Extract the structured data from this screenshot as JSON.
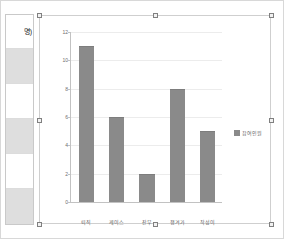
{
  "window": {
    "background": "#ffffff",
    "border_color": "#d8d8d8"
  },
  "spreadsheet_strip": {
    "name": "worksheet-column-strip",
    "visible_cell_text": "명)",
    "cells": [
      {
        "text": "명)",
        "shaded": false
      },
      {
        "text": "",
        "shaded": true
      },
      {
        "text": "",
        "shaded": false
      },
      {
        "text": "",
        "shaded": true
      },
      {
        "text": "",
        "shaded": false
      },
      {
        "text": "",
        "shaded": true
      }
    ]
  },
  "chart_object": {
    "selected": true,
    "handle_count": 8,
    "handle_fill": "#f2f2f2",
    "handle_border": "#808080"
  },
  "chart_data": {
    "type": "bar",
    "title": "",
    "xlabel": "",
    "ylabel": "",
    "categories": [
      "퇴직",
      "케이스",
      "잔무",
      "챙겨가",
      "작성이"
    ],
    "values": [
      11,
      6,
      2,
      8,
      5
    ],
    "series": [
      {
        "name": "참여인원",
        "values": [
          11,
          6,
          2,
          8,
          5
        ],
        "color": "#8a8a8a"
      }
    ],
    "ylim": [
      0,
      12
    ],
    "yticks": [
      0,
      2,
      4,
      6,
      8,
      10,
      12
    ],
    "ytick_labels": [
      "0",
      "2",
      "4",
      "6",
      "8",
      "10",
      "12"
    ],
    "grid": true,
    "gridline_color": "#ececec",
    "axis_color": "#c2c2c2",
    "plot_background": "#ffffff",
    "legend": {
      "visible": true,
      "position": "right",
      "entries": [
        {
          "label": "참여인원",
          "color": "#8a8a8a"
        }
      ]
    }
  }
}
